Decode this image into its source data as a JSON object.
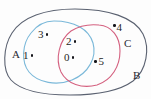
{
  "figure": {
    "type": "venn-diagram",
    "title": "",
    "background_color": "#fdfdfd"
  },
  "sets": [
    {
      "id": "A",
      "label": "A",
      "color": "#7ab8d9",
      "label_x": 12,
      "label_y": 55
    },
    {
      "id": "B",
      "label": "B",
      "color": "#5a6170",
      "label_x": 133,
      "label_y": 76
    },
    {
      "id": "C",
      "label": "C",
      "color": "#d4607f",
      "label_x": 124,
      "label_y": 44
    }
  ],
  "elements": [
    {
      "value": "3",
      "region": "A-only",
      "x": 41,
      "y": 34,
      "dot_side": "right"
    },
    {
      "value": "1",
      "region": "A-only",
      "x": 26,
      "y": 55,
      "dot_side": "right"
    },
    {
      "value": "2",
      "region": "A-and-C",
      "x": 69,
      "y": 41,
      "dot_side": "right"
    },
    {
      "value": "0",
      "region": "A-and-C",
      "x": 67,
      "y": 57,
      "dot_side": "right"
    },
    {
      "value": "5",
      "region": "C-only",
      "x": 96,
      "y": 61,
      "dot_side": "left"
    },
    {
      "value": "4",
      "region": "B-only",
      "x": 115,
      "y": 27,
      "dot_side": "left"
    }
  ]
}
